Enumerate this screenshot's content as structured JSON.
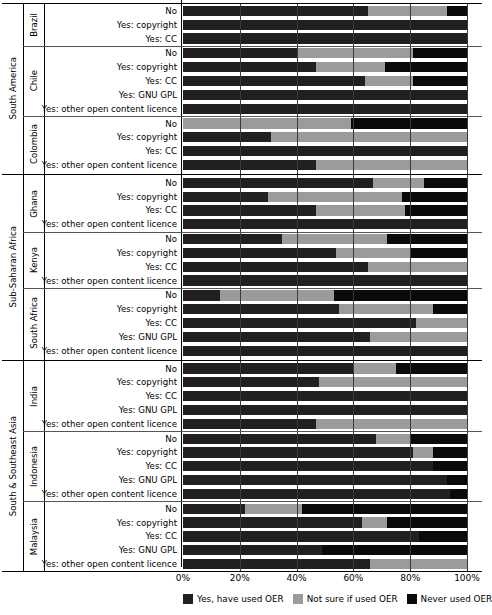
{
  "chart_data": {
    "type": "bar",
    "orientation": "horizontal",
    "stacked": true,
    "title": "",
    "xlabel": "",
    "ylabel": "",
    "xlim": [
      0,
      100
    ],
    "grid": true,
    "legend_position": "bottom",
    "axis_ticks": [
      "0%",
      "20%",
      "40%",
      "60%",
      "80%",
      "100%"
    ],
    "axis_tick_values": [
      0,
      20,
      40,
      60,
      80,
      100
    ],
    "series": [
      {
        "name": "Yes, have used OER",
        "color": "#211f1f"
      },
      {
        "name": "Not sure if used OER",
        "color": "#9b9b9b"
      },
      {
        "name": "Never used OER",
        "color": "#0a0a0a"
      }
    ],
    "regions": [
      {
        "name": "South America",
        "countries": [
          {
            "name": "Brazil",
            "rows": [
              {
                "label": "No",
                "values": [
                  65,
                  28,
                  7
                ]
              },
              {
                "label": "Yes: copyright",
                "values": [
                  100,
                  0,
                  0
                ]
              },
              {
                "label": "Yes: CC",
                "values": [
                  100,
                  0,
                  0
                ]
              }
            ]
          },
          {
            "name": "Chile",
            "rows": [
              {
                "label": "No",
                "values": [
                  40,
                  41,
                  19
                ]
              },
              {
                "label": "Yes: copyright",
                "values": [
                  47,
                  24,
                  29
                ]
              },
              {
                "label": "Yes: CC",
                "values": [
                  64,
                  17,
                  19
                ]
              },
              {
                "label": "Yes: GNU GPL",
                "values": [
                  100,
                  0,
                  0
                ]
              },
              {
                "label": "Yes: other open content licence",
                "values": [
                  100,
                  0,
                  0
                ]
              }
            ]
          },
          {
            "name": "Colombia",
            "rows": [
              {
                "label": "No",
                "values": [
                  0,
                  59,
                  41
                ]
              },
              {
                "label": "Yes: copyright",
                "values": [
                  31,
                  69,
                  0
                ]
              },
              {
                "label": "Yes: CC",
                "values": [
                  100,
                  0,
                  0
                ]
              },
              {
                "label": "Yes: other open content licence",
                "values": [
                  47,
                  53,
                  0
                ]
              }
            ]
          }
        ]
      },
      {
        "name": "Sub-Saharan Africa",
        "countries": [
          {
            "name": "Ghana",
            "rows": [
              {
                "label": "No",
                "values": [
                  67,
                  18,
                  15
                ]
              },
              {
                "label": "Yes: copyright",
                "values": [
                  30,
                  47,
                  23
                ]
              },
              {
                "label": "Yes: CC",
                "values": [
                  47,
                  31,
                  22
                ]
              },
              {
                "label": "Yes: other open content licence",
                "values": [
                  100,
                  0,
                  0
                ]
              }
            ]
          },
          {
            "name": "Kenya",
            "rows": [
              {
                "label": "No",
                "values": [
                  35,
                  37,
                  28
                ]
              },
              {
                "label": "Yes: copyright",
                "values": [
                  54,
                  26,
                  20
                ]
              },
              {
                "label": "Yes: CC",
                "values": [
                  65,
                  35,
                  0
                ]
              },
              {
                "label": "Yes: other open content licence",
                "values": [
                  100,
                  0,
                  0
                ]
              }
            ]
          },
          {
            "name": "South Africa",
            "rows": [
              {
                "label": "No",
                "values": [
                  13,
                  40,
                  47
                ]
              },
              {
                "label": "Yes: copyright",
                "values": [
                  55,
                  33,
                  12
                ]
              },
              {
                "label": "Yes: CC",
                "values": [
                  82,
                  18,
                  0
                ]
              },
              {
                "label": "Yes: GNU GPL",
                "values": [
                  66,
                  34,
                  0
                ]
              },
              {
                "label": "Yes: other open content licence",
                "values": [
                  100,
                  0,
                  0
                ]
              }
            ]
          }
        ]
      },
      {
        "name": "South & Southeast Asia",
        "countries": [
          {
            "name": "India",
            "rows": [
              {
                "label": "No",
                "values": [
                  60,
                  15,
                  25
                ]
              },
              {
                "label": "Yes: copyright",
                "values": [
                  48,
                  52,
                  0
                ]
              },
              {
                "label": "Yes: CC",
                "values": [
                  100,
                  0,
                  0
                ]
              },
              {
                "label": "Yes: GNU GPL",
                "values": [
                  100,
                  0,
                  0
                ]
              },
              {
                "label": "Yes: other open content licence",
                "values": [
                  47,
                  53,
                  0
                ]
              }
            ]
          },
          {
            "name": "Indonesia",
            "rows": [
              {
                "label": "No",
                "values": [
                  68,
                  12,
                  20
                ]
              },
              {
                "label": "Yes: copyright",
                "values": [
                  81,
                  7,
                  12
                ]
              },
              {
                "label": "Yes: CC",
                "values": [
                  88,
                  0,
                  12
                ]
              },
              {
                "label": "Yes: GNU GPL",
                "values": [
                  93,
                  0,
                  7
                ]
              },
              {
                "label": "Yes: other open content licence",
                "values": [
                  94,
                  0,
                  6
                ]
              }
            ]
          },
          {
            "name": "Malaysia",
            "rows": [
              {
                "label": "No",
                "values": [
                  22,
                  20,
                  58
                ]
              },
              {
                "label": "Yes: copyright",
                "values": [
                  63,
                  9,
                  28
                ]
              },
              {
                "label": "Yes: CC",
                "values": [
                  83,
                  0,
                  17
                ]
              },
              {
                "label": "Yes: GNU GPL",
                "values": [
                  49,
                  0,
                  51
                ]
              },
              {
                "label": "Yes: other open content licence",
                "values": [
                  66,
                  34,
                  0
                ]
              }
            ]
          }
        ]
      }
    ]
  }
}
